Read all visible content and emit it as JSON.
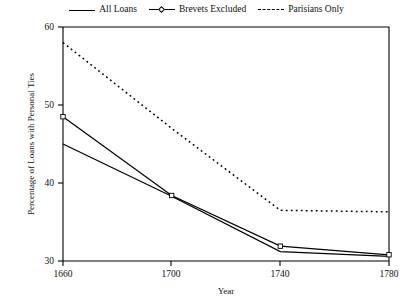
{
  "legend": {
    "items": [
      {
        "label": "All Loans",
        "style": "solid",
        "icon": "solid-line-icon"
      },
      {
        "label": "Brevets Excluded",
        "style": "marked",
        "icon": "marked-line-icon"
      },
      {
        "label": "Parisians Only",
        "style": "dotted",
        "icon": "dotted-line-icon"
      }
    ]
  },
  "axes": {
    "x_title": "Year",
    "y_title": "Percentage of Loans with Personal Ties",
    "x_ticks": [
      "1660",
      "1700",
      "1740",
      "1780"
    ],
    "y_ticks": [
      "30",
      "40",
      "50",
      "60"
    ]
  },
  "chart_data": {
    "type": "line",
    "title": "",
    "xlabel": "Year",
    "ylabel": "Percentage of Loans with Personal Ties",
    "x": [
      1660,
      1700,
      1740,
      1780
    ],
    "xlim": [
      1660,
      1780
    ],
    "ylim": [
      30,
      60
    ],
    "xticks": [
      1660,
      1700,
      1740,
      1780
    ],
    "yticks": [
      30,
      40,
      50,
      60
    ],
    "grid": false,
    "legend_position": "top-center",
    "series": [
      {
        "name": "All Loans",
        "style": "solid",
        "marker": "none",
        "values": [
          45.0,
          38.3,
          31.2,
          30.6
        ]
      },
      {
        "name": "Brevets Excluded",
        "style": "solid",
        "marker": "square",
        "values": [
          48.5,
          38.4,
          31.9,
          30.8
        ]
      },
      {
        "name": "Parisians Only",
        "style": "dotted",
        "marker": "none",
        "values": [
          58.0,
          47.0,
          36.5,
          36.3
        ]
      }
    ]
  },
  "colors": {
    "ink": "#000000",
    "background": "#ffffff"
  }
}
